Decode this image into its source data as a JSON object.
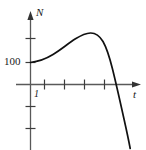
{
  "figure": {
    "kind": "line-plot",
    "background_color": "#ffffff",
    "ink_color": "#1a1a1a",
    "axis_color": "#555555",
    "width": 146,
    "height": 150
  },
  "labels": {
    "y_axis_name": "N",
    "x_axis_name": "t",
    "y_value_label": "100",
    "x_value_label": "1"
  },
  "chart_data": {
    "type": "line",
    "title": "",
    "xlabel": "t",
    "ylabel": "N",
    "grid": false,
    "legend": null,
    "xlim": [
      -0.6,
      7.2
    ],
    "ylim": [
      -260,
      220
    ],
    "x_ticks": [
      1,
      2,
      3,
      4
    ],
    "x_tick_labels": [
      "1",
      "",
      "",
      ""
    ],
    "y_ticks": [
      100,
      200,
      -100,
      -200
    ],
    "y_tick_labels": [
      "100",
      "",
      "",
      ""
    ],
    "annotations": [
      {
        "text": "100",
        "x": 0,
        "y": 100,
        "note": "initial value on N axis"
      },
      {
        "text": "1",
        "x": 1,
        "y": 0,
        "note": "first tick on t axis"
      },
      {
        "text": "N",
        "x": 0,
        "y": 215,
        "note": "vertical axis name"
      },
      {
        "text": "t",
        "x": 7.1,
        "y": 0,
        "note": "horizontal axis name"
      }
    ],
    "series": [
      {
        "name": "N(t)",
        "x": [
          0.0,
          0.3,
          0.6,
          0.9,
          1.2,
          1.5,
          1.8,
          2.1,
          2.4,
          2.7,
          3.0,
          3.3,
          3.6,
          3.9,
          4.2,
          4.5,
          4.8,
          5.1,
          5.4,
          5.7,
          6.0,
          6.3,
          6.6
        ],
        "y": [
          100,
          103,
          108,
          116,
          126,
          138,
          150,
          162,
          172,
          180,
          184,
          185,
          182,
          174,
          160,
          140,
          112,
          74,
          28,
          -28,
          -92,
          -164,
          -244
        ]
      }
    ]
  },
  "geometry": {
    "origin_px": {
      "x": 30,
      "y": 84
    },
    "curve_path": "M 30.5,62.5 C 38,61.6 46,58.8 53,54.5 C 61,49.6 68,43.5 75.5,38.8 C 81,35.4 86,33.2 90.5,33.0 C 95.5,32.9 99.5,35.6 103,41.5 C 106.5,47.6 109.5,57 112.5,69 C 116,83 120,101 124,119 C 126.8,131.5 128.8,141 130.2,148.5",
    "y_axis_line": {
      "x": 30,
      "y_top": 16,
      "y_bottom": 150
    },
    "x_axis_line": {
      "y": 84,
      "x_left": 16,
      "x_right": 140
    },
    "x_ticks_px": [
      44,
      64,
      84,
      104
    ],
    "y_ticks_px": [
      38,
      62,
      106,
      128
    ]
  }
}
